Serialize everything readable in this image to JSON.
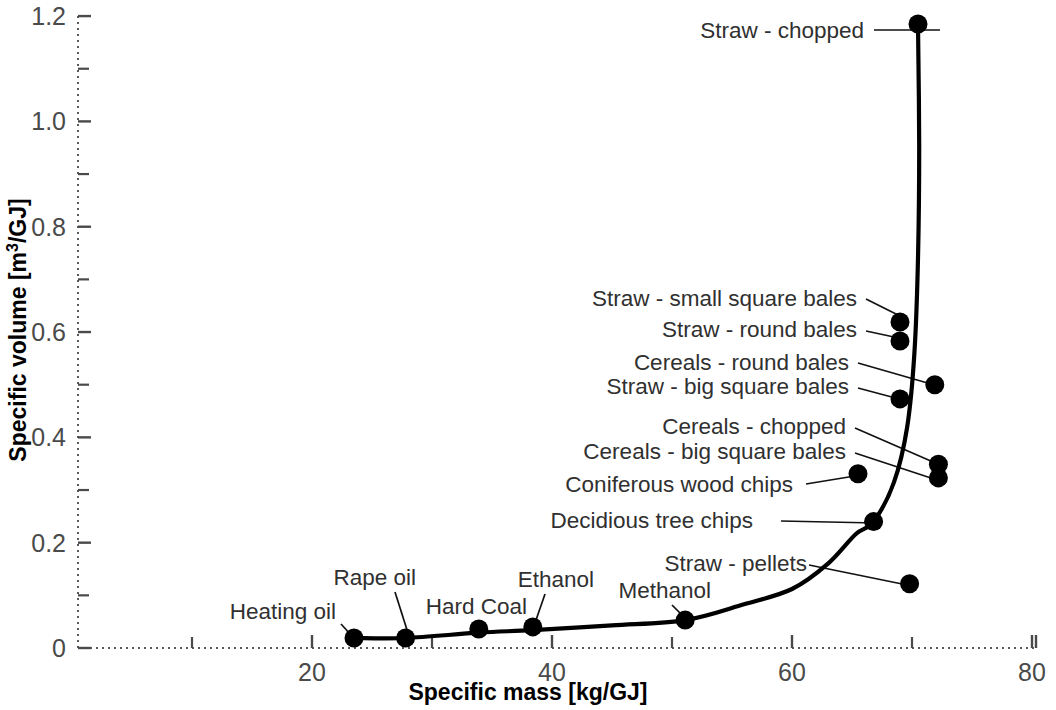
{
  "chart_data": {
    "type": "scatter",
    "title": "",
    "xlabel": "Specific mass [kg/GJ]",
    "ylabel": "Specific volume [m³/GJ]",
    "ylabel_parts": {
      "main": "Specific volume [m",
      "sup": "3",
      "tail": "/GJ]"
    },
    "xlim": [
      0.5,
      80
    ],
    "ylim": [
      0,
      1.2
    ],
    "grid": false,
    "legend": "none",
    "x_ticks_major": [
      "20",
      "40",
      "60",
      "80"
    ],
    "x_ticks_major_values": [
      20,
      40,
      60,
      80
    ],
    "x_ticks_minor_values": [
      10,
      30,
      50,
      70
    ],
    "y_ticks_major": [
      "0",
      "0.2",
      "0.4",
      "0.6",
      "0.8",
      "1.0",
      "1.2"
    ],
    "y_ticks_major_values": [
      0,
      0.2,
      0.4,
      0.6,
      0.8,
      1.0,
      1.2
    ],
    "y_ticks_minor_values": [
      0.1,
      0.3,
      0.5,
      0.7,
      0.9,
      1.1
    ],
    "points": [
      {
        "label": "Heating oil",
        "x": 23.5,
        "y": 0.019
      },
      {
        "label": "Rape oil",
        "x": 27.8,
        "y": 0.019
      },
      {
        "label": "Hard Coal",
        "x": 33.9,
        "y": 0.036
      },
      {
        "label": "Ethanol",
        "x": 38.4,
        "y": 0.04
      },
      {
        "label": "Methanol",
        "x": 51.1,
        "y": 0.053
      },
      {
        "label": "Straw - pellets",
        "x": 69.8,
        "y": 0.122
      },
      {
        "label": "Decidious tree chips",
        "x": 66.8,
        "y": 0.24
      },
      {
        "label": "Coniferous wood chips",
        "x": 65.5,
        "y": 0.331
      },
      {
        "label": "Cereals - big square bales",
        "x": 72.2,
        "y": 0.323
      },
      {
        "label": "Cereals - chopped",
        "x": 72.2,
        "y": 0.349
      },
      {
        "label": "Straw - big square bales",
        "x": 69.0,
        "y": 0.473
      },
      {
        "label": "Cereals - round bales",
        "x": 71.9,
        "y": 0.5
      },
      {
        "label": "Straw - round bales",
        "x": 69.0,
        "y": 0.583
      },
      {
        "label": "Straw - small square bales",
        "x": 69.0,
        "y": 0.619
      },
      {
        "label": "Straw - chopped",
        "x": 70.5,
        "y": 1.185
      }
    ],
    "trend_curve": [
      {
        "x": 23.5,
        "y": 0.019
      },
      {
        "x": 27.8,
        "y": 0.019
      },
      {
        "x": 33.9,
        "y": 0.029
      },
      {
        "x": 38.4,
        "y": 0.034
      },
      {
        "x": 45.0,
        "y": 0.043
      },
      {
        "x": 51.1,
        "y": 0.053
      },
      {
        "x": 56.0,
        "y": 0.083
      },
      {
        "x": 60.0,
        "y": 0.112
      },
      {
        "x": 63.0,
        "y": 0.16
      },
      {
        "x": 65.3,
        "y": 0.216
      },
      {
        "x": 66.8,
        "y": 0.24
      },
      {
        "x": 68.5,
        "y": 0.315
      },
      {
        "x": 69.6,
        "y": 0.42
      },
      {
        "x": 70.2,
        "y": 0.56
      },
      {
        "x": 70.5,
        "y": 0.74
      },
      {
        "x": 70.6,
        "y": 0.95
      },
      {
        "x": 70.5,
        "y": 1.185
      }
    ],
    "labels": [
      {
        "text": "Straw - chopped",
        "tx": 864,
        "ty": 38,
        "anchor": "end",
        "leader": [
          [
            874,
            30
          ],
          [
            940,
            30
          ]
        ]
      },
      {
        "text": "Straw - small square bales",
        "tx": 857,
        "ty": 306,
        "anchor": "end",
        "leader": [
          [
            866,
            299
          ],
          [
            908,
            320
          ]
        ]
      },
      {
        "text": "Straw - round bales",
        "tx": 857,
        "ty": 337,
        "anchor": "end",
        "leader": [
          [
            866,
            331
          ],
          [
            908,
            340
          ]
        ]
      },
      {
        "text": "Cereals - round bales",
        "tx": 849,
        "ty": 370,
        "anchor": "end",
        "leader": [
          [
            858,
            363
          ],
          [
            938,
            386
          ]
        ]
      },
      {
        "text": "Straw - big square bales",
        "tx": 849,
        "ty": 394,
        "anchor": "end",
        "leader": [
          [
            858,
            388
          ],
          [
            903,
            400
          ]
        ]
      },
      {
        "text": "Cereals - chopped",
        "tx": 846,
        "ty": 434,
        "anchor": "end",
        "leader": [
          [
            855,
            428
          ],
          [
            940,
            465
          ]
        ]
      },
      {
        "text": "Cereals - big square bales",
        "tx": 846,
        "ty": 459,
        "anchor": "end",
        "leader": [
          [
            855,
            453
          ],
          [
            940,
            481
          ]
        ]
      },
      {
        "text": "Coniferous wood chips",
        "tx": 793,
        "ty": 492,
        "anchor": "end",
        "leader": [
          [
            806,
            484
          ],
          [
            861,
            475
          ]
        ]
      },
      {
        "text": "Decidious tree chips",
        "tx": 753,
        "ty": 528,
        "anchor": "end",
        "leader": [
          [
            781,
            521
          ],
          [
            876,
            523
          ]
        ]
      },
      {
        "text": "Straw - pellets",
        "tx": 807,
        "ty": 571,
        "anchor": "end",
        "leader": [
          [
            809,
            565
          ],
          [
            912,
            586
          ]
        ]
      },
      {
        "text": "Methanol",
        "tx": 711,
        "ty": 598,
        "anchor": "end",
        "leader": [
          [
            672,
            605
          ],
          [
            687,
            620
          ]
        ]
      },
      {
        "text": "Ethanol",
        "tx": 594,
        "ty": 587,
        "anchor": "end",
        "leader": [
          [
            545,
            594
          ],
          [
            535,
            623
          ]
        ]
      },
      {
        "text": "Hard Coal",
        "tx": 527,
        "ty": 614,
        "anchor": "end",
        "leader": [
          [
            481,
            620
          ],
          [
            481,
            628
          ]
        ]
      },
      {
        "text": "Rape oil",
        "tx": 416,
        "ty": 585,
        "anchor": "end",
        "leader": [
          [
            395,
            592
          ],
          [
            408,
            633
          ]
        ]
      },
      {
        "text": "Heating oil",
        "tx": 336,
        "ty": 619,
        "anchor": "end",
        "leader": [
          [
            341,
            624
          ],
          [
            352,
            636
          ]
        ]
      }
    ]
  }
}
